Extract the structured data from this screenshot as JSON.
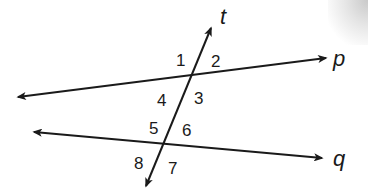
{
  "diagram": {
    "type": "parallel lines cut by a transversal",
    "lines": {
      "p": {
        "label": "p",
        "x1": 18,
        "y1": 97,
        "x2": 326,
        "y2": 58
      },
      "q": {
        "label": "q",
        "x1": 34,
        "y1": 132,
        "x2": 322,
        "y2": 158
      },
      "t": {
        "label": "t",
        "x1": 211,
        "y1": 28,
        "x2": 146,
        "y2": 186
      }
    },
    "line_labels": {
      "p": "p",
      "q": "q",
      "t": "t"
    },
    "angle_labels": {
      "a1": "1",
      "a2": "2",
      "a3": "3",
      "a4": "4",
      "a5": "5",
      "a6": "6",
      "a7": "7",
      "a8": "8"
    },
    "stroke_color": "#1a1a1a",
    "background": "#ffffff"
  }
}
